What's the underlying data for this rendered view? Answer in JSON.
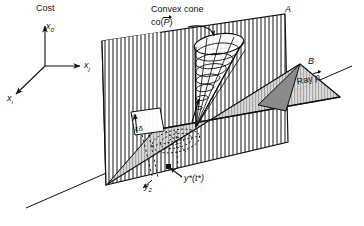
{
  "figure": {
    "axes": {
      "cost_label": "Cost",
      "vertical_axis": "x",
      "vertical_axis_sub": "0",
      "right_axis": "x",
      "right_axis_sub": "j",
      "left_axis": "x",
      "left_axis_sub": "i"
    },
    "annotations": {
      "convex_cone_line1": "Convex cone",
      "convex_cone_line2_prefix": "co(",
      "convex_cone_line2_symbol": "P",
      "convex_cone_line2_suffix": ")",
      "plane_a_label": "A",
      "plane_b_label": "B",
      "ray_label_prefix": "Ray ",
      "ray_label_symbol": "p",
      "y_label": "y",
      "eps_delta_label": "εδ",
      "y2_label": "y",
      "y2_label_sub": "2",
      "y_star_label": "y*(t*)"
    },
    "colors": {
      "ink": "#111111",
      "hatch": "#2b2b2b",
      "plane_b_fill": "#cfcfcf",
      "background": "#ffffff"
    }
  }
}
